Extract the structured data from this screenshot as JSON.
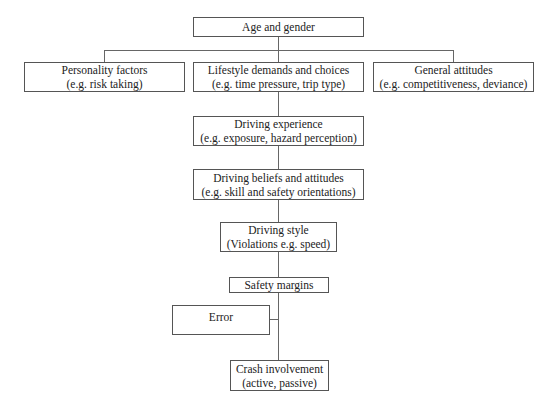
{
  "diagram": {
    "nodes": {
      "age": {
        "line1": "Age and gender"
      },
      "personality": {
        "line1": "Personality factors",
        "line2": "(e.g. risk taking)"
      },
      "lifestyle": {
        "line1": "Lifestyle demands and choices",
        "line2": "(e.g. time pressure, trip type)"
      },
      "general": {
        "line1": "General attitudes",
        "line2": "(e.g. competitiveness, deviance)"
      },
      "experience": {
        "line1": "Driving experience",
        "line2": "(e.g. exposure, hazard perception)"
      },
      "beliefs": {
        "line1": "Driving beliefs and attitudes",
        "line2": "(e.g. skill and safety orientations)"
      },
      "style": {
        "line1": "Driving style",
        "line2": "(Violations e.g. speed)"
      },
      "safety": {
        "line1": "Safety margins"
      },
      "error": {
        "line1": "Error"
      },
      "crash": {
        "line1": "Crash involvement",
        "line2": "(active, passive)"
      }
    },
    "edges": [
      [
        "age",
        "personality"
      ],
      [
        "age",
        "lifestyle"
      ],
      [
        "age",
        "general"
      ],
      [
        "lifestyle",
        "experience"
      ],
      [
        "experience",
        "beliefs"
      ],
      [
        "beliefs",
        "style"
      ],
      [
        "style",
        "safety"
      ],
      [
        "safety",
        "crash"
      ],
      [
        "error",
        "crash"
      ]
    ]
  }
}
